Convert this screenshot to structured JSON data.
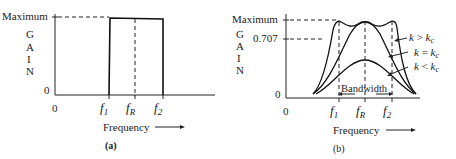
{
  "panel_a": {
    "y_max_label": "Maximum",
    "y_zero_label": "0",
    "y_axis_letters": [
      "G",
      "A",
      "I",
      "N"
    ],
    "x_origin_label": "0",
    "x_ticks": [
      {
        "main": "f",
        "sub": "1"
      },
      {
        "main": "f",
        "sub": "R"
      },
      {
        "main": "f",
        "sub": "2"
      }
    ],
    "x_axis_label": "Frequency",
    "caption": "(a)"
  },
  "panel_b": {
    "y_max_label": "Maximum",
    "y_mid_label": "0.707",
    "y_zero_label": "0",
    "y_axis_letters": [
      "G",
      "A",
      "I",
      "N"
    ],
    "x_origin_label": "0",
    "x_ticks": [
      {
        "main": "f",
        "sub": "1"
      },
      {
        "main": "f",
        "sub": "R"
      },
      {
        "main": "f",
        "sub": "2"
      }
    ],
    "x_axis_label": "Frequency",
    "bandwidth_label": "Bandwidth",
    "curve_labels": [
      {
        "k": "k",
        "op": ">",
        "kc": "k",
        "sub": "c"
      },
      {
        "k": "k",
        "op": "=",
        "kc": "k",
        "sub": "c"
      },
      {
        "k": "k",
        "op": "<",
        "kc": "k",
        "sub": "c"
      }
    ],
    "caption": "(b)"
  }
}
